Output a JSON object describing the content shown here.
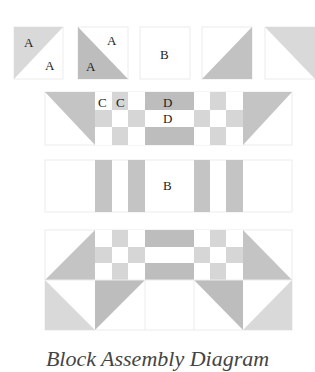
{
  "diagram": {
    "colors": {
      "light": "#d9d9d9",
      "medium": "#c4c4c4",
      "dark": "#b8b8b8",
      "white": "#ffffff",
      "outline": "#e6e6e6",
      "text": "#222222"
    },
    "units": [
      {
        "name": "unit-hst-light-top-left",
        "labels": [
          "A",
          "A"
        ]
      },
      {
        "name": "unit-hst-dark-bottom-left",
        "labels": [
          "A",
          "A"
        ]
      },
      {
        "name": "unit-square-b",
        "labels": [
          "B"
        ]
      },
      {
        "name": "unit-triangle-dark-bottom-right",
        "labels": []
      },
      {
        "name": "unit-triangle-light-top-right",
        "labels": []
      }
    ],
    "row2_labels": {
      "c1": "C",
      "c2": "C",
      "d1": "D",
      "d2": "D"
    },
    "row3_label": "B",
    "caption": "Block Assembly Diagram"
  }
}
